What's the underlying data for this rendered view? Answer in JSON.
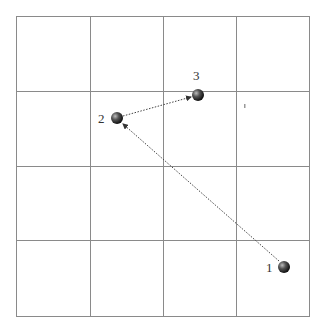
{
  "diagram": {
    "grid": {
      "rows": 4,
      "cols": 4,
      "line_color": "#8a8a8a"
    },
    "points": [
      {
        "id": "1",
        "label": "1",
        "x": 284,
        "y": 267
      },
      {
        "id": "2",
        "label": "2",
        "x": 117,
        "y": 118
      },
      {
        "id": "3",
        "label": "3",
        "x": 198,
        "y": 95
      }
    ],
    "arrows": [
      {
        "from": "1",
        "to": "2",
        "style": "dotted"
      },
      {
        "from": "2",
        "to": "3",
        "style": "dotted"
      }
    ],
    "colors": {
      "ball": "#333333",
      "arrow": "#444444"
    }
  }
}
